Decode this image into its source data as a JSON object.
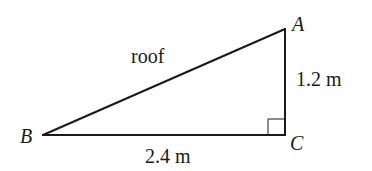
{
  "diagram": {
    "type": "right-triangle",
    "vertices": {
      "A": {
        "label": "A",
        "x": 285,
        "y": 29
      },
      "B": {
        "label": "B",
        "x": 43,
        "y": 135
      },
      "C": {
        "label": "C",
        "x": 285,
        "y": 135
      }
    },
    "right_angle_at": "C",
    "labels": {
      "hypotenuse": "roof",
      "vertical_side": "1.2 m",
      "horizontal_side": "2.4 m"
    },
    "colors": {
      "stroke": "#1a1a1a",
      "background": "#ffffff"
    }
  }
}
